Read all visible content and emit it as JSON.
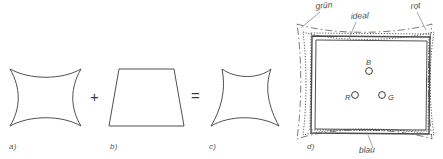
{
  "figure": {
    "background_color": "#ffffff",
    "stroke_color": "#3c3c3c",
    "label_color": "#55565a",
    "panels": [
      {
        "id": "a",
        "label": "a)",
        "shape": "pincushion-distortion-square",
        "description": "square with concave (inward curved) sides"
      },
      {
        "id": "b",
        "label": "b)",
        "shape": "trapezoid",
        "description": "keystone trapezoid, narrower at the top"
      },
      {
        "id": "c",
        "label": "c)",
        "shape": "pincushion-trapezoid-combination",
        "description": "trapezoid with concave curved sides"
      },
      {
        "id": "d",
        "label": "d)",
        "shape": "convergence-test-frame",
        "description": "overlapping colour channel frames with R G B convergence points"
      }
    ],
    "operators": {
      "plus": "+",
      "equals": "="
    },
    "convergence": {
      "curve_labels": [
        {
          "key": "gruen",
          "text": "grün"
        },
        {
          "key": "ideal",
          "text": "ideal"
        },
        {
          "key": "rot",
          "text": "rot"
        },
        {
          "key": "blau",
          "text": "blau"
        }
      ],
      "points": [
        {
          "key": "B",
          "text": "B"
        },
        {
          "key": "R",
          "text": "R"
        },
        {
          "key": "G",
          "text": "G"
        }
      ]
    }
  }
}
